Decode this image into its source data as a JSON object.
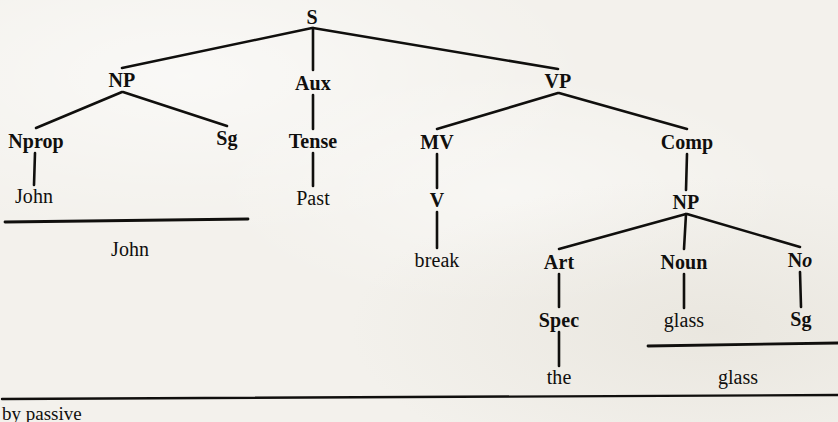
{
  "diagram": {
    "type": "phrase-structure-tree",
    "title_text": "",
    "background_color": "#f3f1ec",
    "ink_color": "#100f0d",
    "nodes": [
      {
        "id": "S",
        "label": "S",
        "x": 312,
        "y": 17,
        "kind": "category"
      },
      {
        "id": "NP1",
        "label": "NP",
        "x": 122,
        "y": 80,
        "kind": "category"
      },
      {
        "id": "Aux",
        "label": "Aux",
        "x": 313,
        "y": 83,
        "kind": "category"
      },
      {
        "id": "VP",
        "label": "VP",
        "x": 558,
        "y": 81,
        "kind": "category"
      },
      {
        "id": "Nprop",
        "label": "Nprop",
        "x": 36,
        "y": 141,
        "kind": "category"
      },
      {
        "id": "Sg1",
        "label": "Sg",
        "x": 227,
        "y": 138,
        "kind": "category"
      },
      {
        "id": "Tense",
        "label": "Tense",
        "x": 313,
        "y": 141,
        "kind": "category"
      },
      {
        "id": "MV",
        "label": "MV",
        "x": 437,
        "y": 142,
        "kind": "category"
      },
      {
        "id": "Comp",
        "label": "Comp",
        "x": 687,
        "y": 142,
        "kind": "category"
      },
      {
        "id": "John_t",
        "label": "John",
        "x": 34,
        "y": 196,
        "kind": "terminal"
      },
      {
        "id": "Past_t",
        "label": "Past",
        "x": 313,
        "y": 198,
        "kind": "terminal"
      },
      {
        "id": "V",
        "label": "V",
        "x": 437,
        "y": 200,
        "kind": "category"
      },
      {
        "id": "NP2",
        "label": "NP",
        "x": 686,
        "y": 202,
        "kind": "category"
      },
      {
        "id": "break_t",
        "label": "break",
        "x": 437,
        "y": 260,
        "kind": "terminal"
      },
      {
        "id": "Art",
        "label": "Art",
        "x": 559,
        "y": 262,
        "kind": "category"
      },
      {
        "id": "Noun",
        "label": "Noun",
        "x": 684,
        "y": 262,
        "kind": "category"
      },
      {
        "id": "No",
        "label": "No",
        "x": 800,
        "y": 260,
        "kind": "category",
        "italic_tail": "o",
        "stem": "N"
      },
      {
        "id": "Spec",
        "label": "Spec",
        "x": 559,
        "y": 320,
        "kind": "category"
      },
      {
        "id": "glass_t",
        "label": "glass",
        "x": 684,
        "y": 320,
        "kind": "terminal"
      },
      {
        "id": "Sg2",
        "label": "Sg",
        "x": 801,
        "y": 319,
        "kind": "category"
      },
      {
        "id": "the_t",
        "label": "the",
        "x": 559,
        "y": 377,
        "kind": "terminal"
      }
    ],
    "edges": [
      {
        "from": "S",
        "to": "NP1",
        "x1": 312,
        "y1": 28,
        "x2": 122,
        "y2": 68,
        "width": 2.6
      },
      {
        "from": "S",
        "to": "Aux",
        "x1": 313,
        "y1": 28,
        "x2": 313,
        "y2": 70,
        "width": 2.6
      },
      {
        "from": "S",
        "to": "VP",
        "x1": 313,
        "y1": 28,
        "x2": 558,
        "y2": 69,
        "width": 2.6
      },
      {
        "from": "NP1",
        "to": "Nprop",
        "x1": 122,
        "y1": 92,
        "x2": 36,
        "y2": 128,
        "width": 2.6
      },
      {
        "from": "NP1",
        "to": "Sg1",
        "x1": 123,
        "y1": 92,
        "x2": 227,
        "y2": 126,
        "width": 2.6
      },
      {
        "from": "Aux",
        "to": "Tense",
        "x1": 313,
        "y1": 95,
        "x2": 313,
        "y2": 129,
        "width": 2.6
      },
      {
        "from": "VP",
        "to": "MV",
        "x1": 558,
        "y1": 93,
        "x2": 437,
        "y2": 129,
        "width": 2.6
      },
      {
        "from": "VP",
        "to": "Comp",
        "x1": 559,
        "y1": 93,
        "x2": 687,
        "y2": 129,
        "width": 2.6
      },
      {
        "from": "Nprop",
        "to": "John_t",
        "x1": 35,
        "y1": 153,
        "x2": 34,
        "y2": 185,
        "width": 2.6
      },
      {
        "from": "Tense",
        "to": "Past_t",
        "x1": 313,
        "y1": 153,
        "x2": 313,
        "y2": 186,
        "width": 2.6
      },
      {
        "from": "MV",
        "to": "V",
        "x1": 437,
        "y1": 154,
        "x2": 437,
        "y2": 188,
        "width": 2.6
      },
      {
        "from": "Comp",
        "to": "NP2",
        "x1": 687,
        "y1": 154,
        "x2": 686,
        "y2": 190,
        "width": 2.6
      },
      {
        "from": "V",
        "to": "break_t",
        "x1": 437,
        "y1": 212,
        "x2": 437,
        "y2": 248,
        "width": 2.6
      },
      {
        "from": "NP2",
        "to": "Art",
        "x1": 686,
        "y1": 214,
        "x2": 559,
        "y2": 249,
        "width": 2.6
      },
      {
        "from": "NP2",
        "to": "Noun",
        "x1": 686,
        "y1": 214,
        "x2": 684,
        "y2": 249,
        "width": 2.6
      },
      {
        "from": "NP2",
        "to": "No",
        "x1": 687,
        "y1": 214,
        "x2": 800,
        "y2": 247,
        "width": 2.6
      },
      {
        "from": "Art",
        "to": "Spec",
        "x1": 559,
        "y1": 274,
        "x2": 559,
        "y2": 307,
        "width": 2.6
      },
      {
        "from": "Noun",
        "to": "glass_t",
        "x1": 684,
        "y1": 274,
        "x2": 684,
        "y2": 308,
        "width": 2.6
      },
      {
        "from": "No",
        "to": "Sg2",
        "x1": 800,
        "y1": 272,
        "x2": 801,
        "y2": 307,
        "width": 2.6
      },
      {
        "from": "Spec",
        "to": "the_t",
        "x1": 559,
        "y1": 332,
        "x2": 559,
        "y2": 366,
        "width": 2.6
      }
    ],
    "summaries": [
      {
        "id": "sum-john",
        "label": "John",
        "label_x": 130,
        "label_y": 249,
        "rule_x1": 5,
        "rule_y1": 222,
        "rule_x2": 248,
        "rule_y2": 219,
        "rule_width": 2.8
      },
      {
        "id": "sum-glass",
        "label": "glass",
        "label_x": 738,
        "label_y": 377,
        "rule_x1": 648,
        "rule_y1": 346,
        "rule_x2": 838,
        "rule_y2": 343,
        "rule_width": 2.8
      }
    ],
    "divider": {
      "id": "bottom-rule",
      "x1": 2,
      "y1": 399,
      "x2": 838,
      "y2": 395,
      "width": 2.4
    },
    "footnote": {
      "text": "by passive",
      "clipped": true
    }
  }
}
